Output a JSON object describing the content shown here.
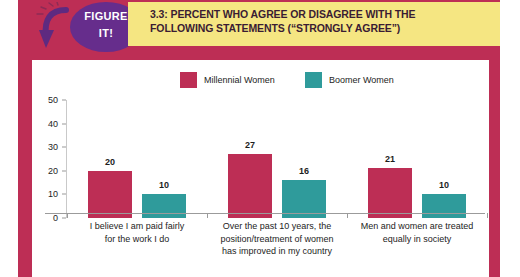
{
  "header": {
    "badge_line1": "FIGURE",
    "badge_line2": "IT!",
    "title_line1": "3.3: PERCENT WHO AGREE OR DISAGREE WITH THE",
    "title_line2": "FOLLOWING STATEMENTS (“STRONGLY AGREE”)",
    "band_color": "#bd2e55",
    "banner_color": "#f5e682",
    "badge_color": "#662d8c",
    "arrow_icon": "curved-down-arrow-icon"
  },
  "chart_data": {
    "type": "bar",
    "title": "3.3: PERCENT WHO AGREE OR DISAGREE WITH THE FOLLOWING STATEMENTS (“STRONGLY AGREE”)",
    "xlabel": "",
    "ylabel": "",
    "ylim": [
      0,
      50
    ],
    "yticks": [
      0,
      10,
      20,
      30,
      40,
      50
    ],
    "grid": false,
    "legend_position": "top-center",
    "categories": [
      "I believe I am paid fairly for the work I do",
      "Over the past 10 years, the position/treatment of women has improved in my country",
      "Men and women are treated equally in society"
    ],
    "category_lines": [
      [
        "I believe I am paid fairly",
        "for the work I do"
      ],
      [
        "Over the past 10 years, the",
        "position/treatment of women",
        "has improved in my country"
      ],
      [
        "Men and women are treated",
        "equally in society"
      ]
    ],
    "series": [
      {
        "name": "Millennial Women",
        "color": "#bd2e55",
        "values": [
          20,
          27,
          21
        ]
      },
      {
        "name": "Boomer Women",
        "color": "#2f9b9b",
        "values": [
          10,
          16,
          10
        ]
      }
    ]
  }
}
